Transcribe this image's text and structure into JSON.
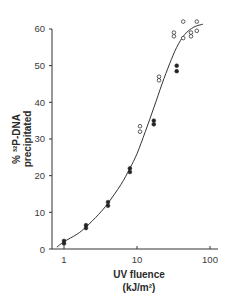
{
  "chart_data": {
    "type": "scatter",
    "title": "",
    "xlabel": "UV fluence",
    "xlabel_unit": "(kJ/m²)",
    "ylabel_line1": "% ³²P-DNA",
    "ylabel_line2": "precipitated",
    "xscale": "log",
    "xlim": [
      0.8,
      120
    ],
    "ylim": [
      0,
      60
    ],
    "x_ticks": [
      1,
      10,
      100
    ],
    "x_tick_labels": [
      "1",
      "10",
      "100"
    ],
    "y_ticks": [
      0,
      10,
      20,
      30,
      40,
      50,
      60
    ],
    "y_tick_labels": [
      "0",
      "10",
      "20",
      "30",
      "40",
      "50",
      "60"
    ],
    "grid": false,
    "legend": null,
    "series": [
      {
        "name": "filled circles",
        "marker": "filled-circle",
        "points": [
          [
            1,
            1.5
          ],
          [
            1,
            2.2
          ],
          [
            2,
            5.7
          ],
          [
            2,
            6.5
          ],
          [
            4,
            11.8
          ],
          [
            4,
            12.8
          ],
          [
            8,
            21
          ],
          [
            8,
            22
          ],
          [
            17,
            34
          ],
          [
            17,
            35
          ],
          [
            35,
            48.5
          ],
          [
            35,
            50
          ]
        ]
      },
      {
        "name": "open circles",
        "marker": "open-circle",
        "points": [
          [
            11,
            32
          ],
          [
            11,
            33.5
          ],
          [
            20,
            46
          ],
          [
            20,
            47
          ],
          [
            32,
            58
          ],
          [
            32,
            59
          ],
          [
            43,
            57.5
          ],
          [
            43,
            62
          ],
          [
            55,
            58
          ],
          [
            55,
            59
          ],
          [
            66,
            59.5
          ],
          [
            66,
            62
          ]
        ]
      },
      {
        "name": "fitted curve",
        "marker": "line",
        "points": [
          [
            0.8,
            0.5
          ],
          [
            1,
            2
          ],
          [
            1.5,
            4
          ],
          [
            2,
            6
          ],
          [
            3,
            9.5
          ],
          [
            4,
            12.5
          ],
          [
            6,
            17.5
          ],
          [
            8,
            22
          ],
          [
            10,
            26
          ],
          [
            13,
            32
          ],
          [
            17,
            38.5
          ],
          [
            22,
            45
          ],
          [
            28,
            50.5
          ],
          [
            35,
            55
          ],
          [
            45,
            58.5
          ],
          [
            60,
            60.5
          ],
          [
            80,
            61.3
          ]
        ]
      }
    ]
  }
}
